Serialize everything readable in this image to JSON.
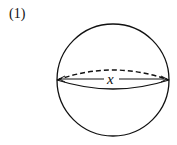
{
  "figure": {
    "label": "(1)",
    "shape": "sphere",
    "diameter_label": "x",
    "stroke_color": "#111111",
    "background": "#ffffff"
  }
}
